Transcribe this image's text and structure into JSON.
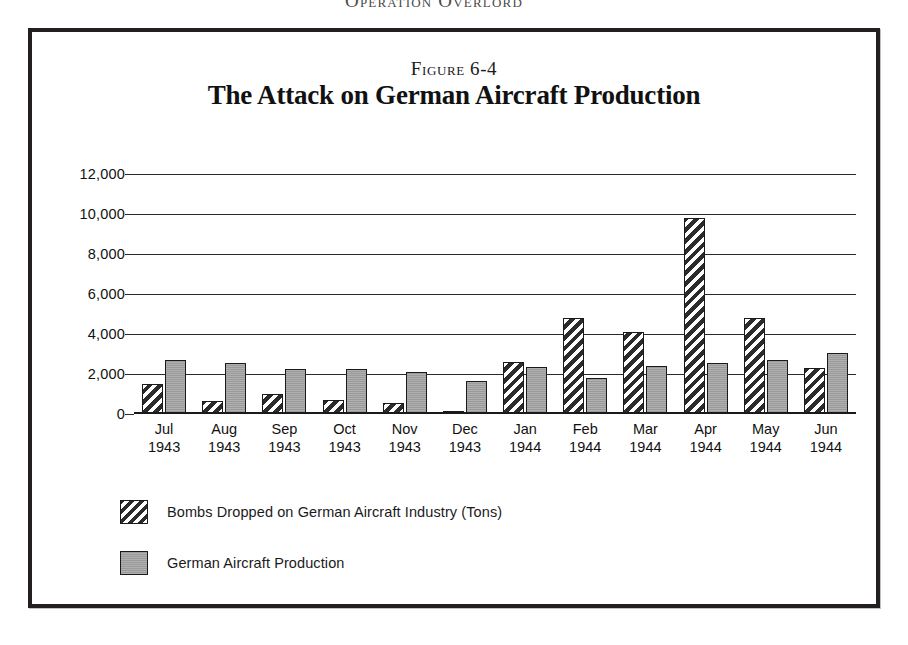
{
  "page": {
    "running_header": "Operation Overlord"
  },
  "figure": {
    "number_label": "Figure 6-4",
    "title": "The Attack on German Aircraft Production"
  },
  "chart_data": {
    "type": "bar",
    "title": "The Attack on German Aircraft Production",
    "subtitle": "Figure 6-4",
    "xlabel": "",
    "ylabel": "",
    "grid": true,
    "legend_position": "bottom-left",
    "ylim": [
      0,
      12000
    ],
    "yticks": [
      0,
      2000,
      4000,
      6000,
      8000,
      10000,
      12000
    ],
    "ytick_labels": [
      "0",
      "2,000",
      "4,000",
      "6,000",
      "8,000",
      "10,000",
      "12,000"
    ],
    "categories": [
      {
        "month": "Jul",
        "year": "1943"
      },
      {
        "month": "Aug",
        "year": "1943"
      },
      {
        "month": "Sep",
        "year": "1943"
      },
      {
        "month": "Oct",
        "year": "1943"
      },
      {
        "month": "Nov",
        "year": "1943"
      },
      {
        "month": "Dec",
        "year": "1943"
      },
      {
        "month": "Jan",
        "year": "1944"
      },
      {
        "month": "Feb",
        "year": "1944"
      },
      {
        "month": "Mar",
        "year": "1944"
      },
      {
        "month": "Apr",
        "year": "1944"
      },
      {
        "month": "May",
        "year": "1944"
      },
      {
        "month": "Jun",
        "year": "1944"
      }
    ],
    "series": [
      {
        "name": "Bombs Dropped on German Aircraft Industry (Tons)",
        "pattern": "diagonal-hatch",
        "color": "#2b2b2b",
        "values": [
          1500,
          650,
          1000,
          700,
          550,
          150,
          2600,
          4800,
          4100,
          9800,
          4800,
          2300
        ]
      },
      {
        "name": "German Aircraft Production",
        "pattern": "solid-gray",
        "color": "#9a9a9a",
        "values": [
          2700,
          2550,
          2250,
          2250,
          2100,
          1650,
          2350,
          1800,
          2400,
          2550,
          2700,
          3050
        ]
      }
    ]
  },
  "legend": [
    {
      "label": "Bombs Dropped on German Aircraft Industry (Tons)",
      "swatch": "bombs"
    },
    {
      "label": "German Aircraft Production",
      "swatch": "production"
    }
  ]
}
